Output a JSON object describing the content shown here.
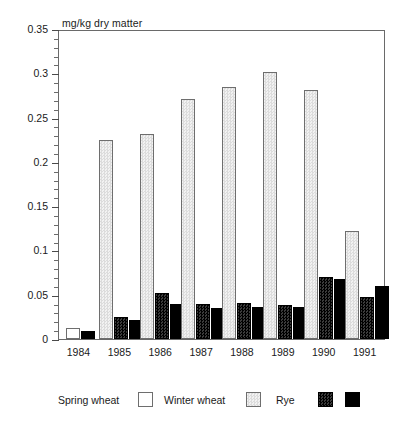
{
  "chart_data": {
    "type": "bar",
    "title": "mg/kg dry matter",
    "xlabel": "",
    "ylabel": "mg/kg dry matter",
    "ylim": [
      0,
      0.35
    ],
    "ytick_step": 0.05,
    "yticks": [
      0,
      0.05,
      0.1,
      0.15,
      0.2,
      0.25,
      0.3,
      0.35
    ],
    "ytick_labels": [
      "0",
      "0.05",
      "0.1",
      "0.15",
      "0.2",
      "0.25",
      "0.3",
      "0.35"
    ],
    "minor_ticks_per_interval": 5,
    "grid": false,
    "legend_position": "bottom",
    "categories": [
      "1984",
      "1985",
      "1986",
      "1987",
      "1988",
      "1989",
      "1990",
      "1991"
    ],
    "series": [
      {
        "name": "Spring wheat",
        "color": "#ffffff",
        "values": [
          0.013,
          null,
          null,
          null,
          null,
          null,
          null,
          null
        ]
      },
      {
        "name": "Winter wheat",
        "color": "#e8e8e8",
        "values": [
          null,
          0.225,
          0.232,
          0.271,
          0.285,
          0.301,
          0.281,
          0.122
        ]
      },
      {
        "name": "Rye",
        "color": "#1c1c1c",
        "values": [
          null,
          0.025,
          0.052,
          0.039,
          0.041,
          0.038,
          0.07,
          0.048
        ]
      },
      {
        "name": "",
        "color": "#000000",
        "values": [
          0.009,
          0.022,
          0.04,
          0.035,
          0.036,
          0.036,
          0.068,
          0.06
        ]
      }
    ]
  },
  "legend": {
    "entries": [
      {
        "label": "Spring wheat",
        "swatch": "spring"
      },
      {
        "label": "Winter wheat",
        "swatch": "winter"
      },
      {
        "label": "Rye",
        "swatch": "rye"
      }
    ],
    "trailing_swatch": "fourth"
  }
}
